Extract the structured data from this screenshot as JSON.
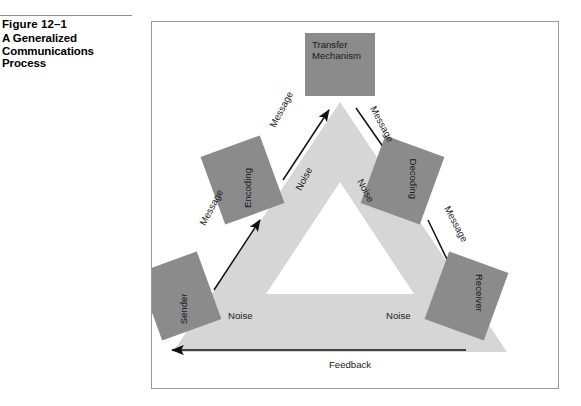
{
  "caption": {
    "figure_number": "Figure 12–1",
    "title_line1": "A Generalized",
    "title_line2": "Communications",
    "title_line3": "Process"
  },
  "colors": {
    "box_fill": "#8b8b8b",
    "band_fill": "#d6d6d6",
    "inner_triangle": "#ffffff",
    "frame_border": "#9a9a9a",
    "text": "#1a1a1a",
    "arrow": "#111111"
  },
  "diagram": {
    "nodes": [
      {
        "id": "transfer",
        "label": "Transfer\nMechanism",
        "label_line1": "Transfer",
        "label_line2": "Mechanism",
        "position": "top"
      },
      {
        "id": "encoding",
        "label": "Encoding",
        "position": "upper-left"
      },
      {
        "id": "decoding",
        "label": "Decoding",
        "position": "upper-right"
      },
      {
        "id": "sender",
        "label": "Sender",
        "position": "bottom-left"
      },
      {
        "id": "receiver",
        "label": "Receiver",
        "position": "bottom-right"
      }
    ],
    "edges": [
      {
        "id": "sender-to-encoding",
        "label": "Message",
        "from": "sender",
        "to": "encoding"
      },
      {
        "id": "encoding-to-transfer",
        "label": "Message",
        "from": "encoding",
        "to": "transfer"
      },
      {
        "id": "transfer-to-decoding",
        "label": "Message",
        "from": "transfer",
        "to": "decoding"
      },
      {
        "id": "decoding-to-receiver",
        "label": "Message",
        "from": "decoding",
        "to": "receiver"
      },
      {
        "id": "receiver-to-sender",
        "label": "Feedback",
        "from": "receiver",
        "to": "sender"
      }
    ],
    "noise_labels": [
      {
        "id": "noise-left",
        "label": "Noise"
      },
      {
        "id": "noise-right",
        "label": "Noise"
      },
      {
        "id": "noise-bottom-left",
        "label": "Noise"
      },
      {
        "id": "noise-bottom-right",
        "label": "Noise"
      }
    ]
  }
}
